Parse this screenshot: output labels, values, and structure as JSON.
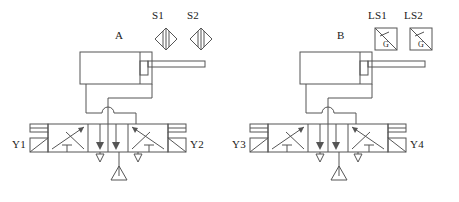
{
  "diagram": {
    "stroke_color": "#555555",
    "text_color": "#1a1a1a",
    "background": "#ffffff"
  },
  "circuits": [
    {
      "id": "left",
      "cylinder": {
        "label": "A",
        "name": "double-acting-cylinder",
        "x": 80,
        "y": 52,
        "width": 72,
        "height": 32,
        "piston_x": 140,
        "rod_y": 64,
        "rod_end_x": 205,
        "rod_height": 6
      },
      "sensors": [
        {
          "label": "S1",
          "type": "diamond",
          "x": 155,
          "y": 28,
          "size": 22,
          "label_x": 151,
          "label_y": 8
        },
        {
          "label": "S2",
          "type": "diamond",
          "x": 190,
          "y": 28,
          "size": 22,
          "label_x": 186,
          "label_y": 8
        }
      ],
      "valve": {
        "name": "5-3-way-valve",
        "x": 48,
        "y": 124,
        "width": 120,
        "height": 28,
        "solenoids": [
          {
            "label": "Y1",
            "side": "left",
            "label_x": 20,
            "label_y": 139
          },
          {
            "label": "Y2",
            "side": "right",
            "label_x": 172,
            "label_y": 139
          }
        ]
      },
      "supply": {
        "name": "pressure-supply",
        "x": 120,
        "y": 176,
        "size": 16
      },
      "exhausts": [
        {
          "name": "exhaust-port",
          "x": 100,
          "y": 154
        },
        {
          "name": "exhaust-port",
          "x": 138,
          "y": 154
        }
      ],
      "offset_x": 0
    },
    {
      "id": "right",
      "cylinder": {
        "label": "B",
        "name": "double-acting-cylinder",
        "x": 300,
        "y": 52,
        "width": 72,
        "height": 32,
        "piston_x": 360,
        "rod_y": 64,
        "rod_end_x": 425,
        "rod_height": 6
      },
      "sensors": [
        {
          "label": "LS1",
          "type": "square",
          "inner_text": "G",
          "x": 375,
          "y": 28,
          "size": 22,
          "label_x": 369,
          "label_y": 8
        },
        {
          "label": "LS2",
          "type": "square",
          "inner_text": "G",
          "x": 410,
          "y": 28,
          "size": 22,
          "label_x": 404,
          "label_y": 8
        }
      ],
      "valve": {
        "name": "5-3-way-valve",
        "x": 268,
        "y": 124,
        "width": 120,
        "height": 28,
        "solenoids": [
          {
            "label": "Y3",
            "side": "left",
            "label_x": 240,
            "label_y": 139
          },
          {
            "label": "Y4",
            "side": "right",
            "label_x": 392,
            "label_y": 139
          }
        ]
      },
      "supply": {
        "name": "pressure-supply",
        "x": 340,
        "y": 176,
        "size": 16
      },
      "exhausts": [
        {
          "name": "exhaust-port",
          "x": 320,
          "y": 154
        },
        {
          "name": "exhaust-port",
          "x": 358,
          "y": 154
        }
      ],
      "offset_x": 220
    }
  ],
  "labels": {
    "cylinder_a": "A",
    "cylinder_b": "B",
    "sensor_s1": "S1",
    "sensor_s2": "S2",
    "sensor_ls1": "LS1",
    "sensor_ls2": "LS2",
    "solenoid_y1": "Y1",
    "solenoid_y2": "Y2",
    "solenoid_y3": "Y3",
    "solenoid_y4": "Y4",
    "limit_switch_inner": "G"
  }
}
